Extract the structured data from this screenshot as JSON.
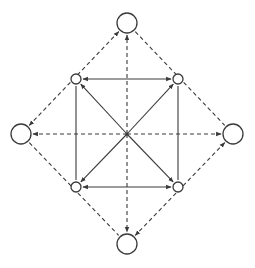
{
  "diagram": {
    "type": "network-graph",
    "colors": {
      "stroke": "#3a3a3a",
      "background": "#ffffff",
      "node_fill": "#ffffff"
    },
    "center": {
      "id": "hub",
      "x": 127,
      "y": 134
    },
    "nodes": [
      {
        "id": "outer-top",
        "x": 127,
        "y": 23,
        "r": 10,
        "ring": "outer"
      },
      {
        "id": "outer-left",
        "x": 21,
        "y": 134,
        "r": 10,
        "ring": "outer"
      },
      {
        "id": "outer-right",
        "x": 233,
        "y": 134,
        "r": 10,
        "ring": "outer"
      },
      {
        "id": "outer-bottom",
        "x": 127,
        "y": 244,
        "r": 10,
        "ring": "outer"
      },
      {
        "id": "inner-top-left",
        "x": 76,
        "y": 79,
        "r": 5,
        "ring": "inner"
      },
      {
        "id": "inner-top-right",
        "x": 178,
        "y": 79,
        "r": 5,
        "ring": "inner"
      },
      {
        "id": "inner-bottom-left",
        "x": 76,
        "y": 187,
        "r": 5,
        "ring": "inner"
      },
      {
        "id": "inner-bottom-right",
        "x": 178,
        "y": 187,
        "r": 5,
        "ring": "inner"
      }
    ],
    "edges": [
      {
        "from": "hub",
        "to": "outer-top",
        "style": "dashed",
        "arrow": "end"
      },
      {
        "from": "hub",
        "to": "outer-bottom",
        "style": "dashed",
        "arrow": "end"
      },
      {
        "from": "hub",
        "to": "outer-left",
        "style": "dashed",
        "arrow": "end"
      },
      {
        "from": "hub",
        "to": "outer-right",
        "style": "dashed",
        "arrow": "end"
      },
      {
        "from": "hub",
        "to": "inner-top-left",
        "style": "solid",
        "arrow": "end"
      },
      {
        "from": "hub",
        "to": "inner-top-right",
        "style": "solid",
        "arrow": "end"
      },
      {
        "from": "hub",
        "to": "inner-bottom-left",
        "style": "solid",
        "arrow": "end"
      },
      {
        "from": "hub",
        "to": "inner-bottom-right",
        "style": "solid",
        "arrow": "end"
      },
      {
        "from": "inner-top-left",
        "to": "inner-top-right",
        "style": "solid",
        "arrow": "both"
      },
      {
        "from": "inner-bottom-left",
        "to": "inner-bottom-right",
        "style": "solid",
        "arrow": "both"
      },
      {
        "from": "inner-top-left",
        "to": "inner-bottom-left",
        "style": "solid",
        "arrow": "none"
      },
      {
        "from": "inner-top-right",
        "to": "inner-bottom-right",
        "style": "solid",
        "arrow": "none"
      },
      {
        "from": "outer-top",
        "to": "outer-left",
        "style": "dashed",
        "arrow": "both"
      },
      {
        "from": "outer-top",
        "to": "outer-right",
        "style": "dashed",
        "arrow": "none"
      },
      {
        "from": "outer-left",
        "to": "outer-bottom",
        "style": "dashed",
        "arrow": "none"
      },
      {
        "from": "outer-right",
        "to": "outer-bottom",
        "style": "dashed",
        "arrow": "both"
      }
    ]
  }
}
